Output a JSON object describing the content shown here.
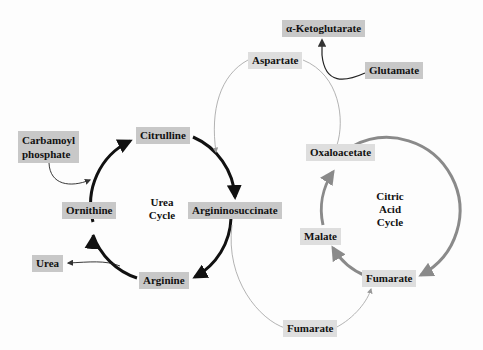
{
  "urea_cycle": {
    "label_line1": "Urea",
    "label_line2": "Cycle",
    "nodes": {
      "citrulline": "Citrulline",
      "argininosuccinate": "Argininosuccinate",
      "arginine": "Arginine",
      "ornithine": "Ornithine"
    },
    "inputs": {
      "carbamoyl_line1": "Carbamoyl",
      "carbamoyl_line2": "phosphate"
    },
    "outputs": {
      "urea": "Urea"
    }
  },
  "citric_acid_cycle": {
    "label_line1": "Citric",
    "label_line2": "Acid",
    "label_line3": "Cycle",
    "nodes": {
      "oxaloacetate": "Oxaloacetate",
      "fumarate": "Fumarate",
      "malate": "Malate"
    }
  },
  "shuttle": {
    "aspartate": "Aspartate",
    "fumarate_bottom": "Fumarate",
    "alpha_ketoglutarate": "α-Ketoglutarate",
    "glutamate": "Glutamate"
  },
  "colors": {
    "urea_ring": "#111111",
    "citric_ring": "#8a8a8a",
    "thin_link": "#9a9a9a",
    "box_dark": "#c8c8c8",
    "box_light": "#dedede"
  }
}
